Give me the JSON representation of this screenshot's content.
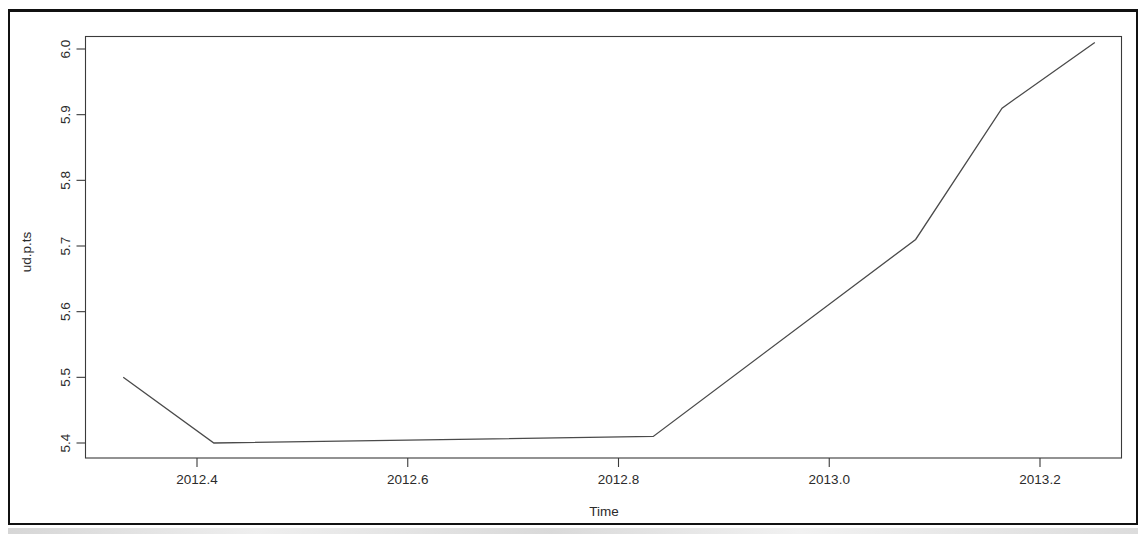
{
  "chart_data": {
    "type": "line",
    "title": "",
    "xlabel": "Time",
    "ylabel": "ud.p.ts",
    "xlim": [
      2012.31,
      2013.27
    ],
    "ylim": [
      5.38,
      6.02
    ],
    "xticks": [
      "2012.4",
      "2012.6",
      "2012.8",
      "2013.0",
      "2013.2"
    ],
    "xtick_values": [
      2012.4,
      2012.6,
      2012.8,
      2013.0,
      2013.2
    ],
    "yticks": [
      "5.4",
      "5.5",
      "5.6",
      "5.7",
      "5.8",
      "5.9",
      "6.0"
    ],
    "ytick_values": [
      5.4,
      5.5,
      5.6,
      5.7,
      5.8,
      5.9,
      6.0
    ],
    "grid": false,
    "legend": false,
    "series": [
      {
        "name": "ud.p.ts",
        "color": "#4a4a4a",
        "x": [
          2012.33,
          2012.416,
          2012.833,
          2013.082,
          2013.164,
          2013.252
        ],
        "y": [
          5.5,
          5.4,
          5.41,
          5.71,
          5.91,
          6.01
        ]
      }
    ]
  },
  "axes": {
    "y_axis_label": "ud.p.ts",
    "x_axis_label": "Time"
  }
}
